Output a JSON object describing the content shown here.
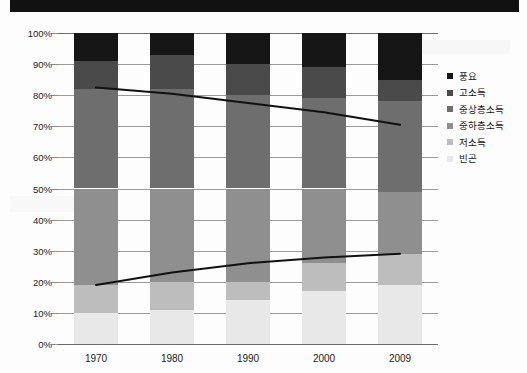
{
  "banner": {
    "color": "#111111",
    "text": ""
  },
  "legend": {
    "position": "right",
    "items": [
      {
        "label": "풍요",
        "color": "#161616"
      },
      {
        "label": "고소득",
        "color": "#4a4a4a"
      },
      {
        "label": "중상층소득",
        "color": "#6e6e6e"
      },
      {
        "label": "중하층소득",
        "color": "#8f8f8f"
      },
      {
        "label": "저소득",
        "color": "#bdbdbd"
      },
      {
        "label": "빈곤",
        "color": "#e8e8e8"
      }
    ]
  },
  "axes": {
    "y_ticks": [
      "0%",
      "10%",
      "20%",
      "30%",
      "40%",
      "50%",
      "60%",
      "70%",
      "80%",
      "90%",
      "100%"
    ],
    "x_ticks": [
      "1970",
      "1980",
      "1990",
      "2000",
      "2009"
    ]
  },
  "chart_data": {
    "type": "bar",
    "title": "",
    "subtitle": "",
    "xlabel": "",
    "ylabel": "",
    "ylim": [
      0,
      100
    ],
    "grid": true,
    "stacked": true,
    "stack_total": 100,
    "legend_position": "right",
    "categories": [
      "1970",
      "1980",
      "1990",
      "2000",
      "2009"
    ],
    "series": [
      {
        "name": "빈곤",
        "color": "#e8e8e8",
        "values": [
          10,
          11,
          14,
          17,
          19
        ]
      },
      {
        "name": "저소득",
        "color": "#bdbdbd",
        "values": [
          9,
          9,
          6,
          9,
          10
        ]
      },
      {
        "name": "중하층소득",
        "color": "#8f8f8f",
        "values": [
          31,
          30,
          30,
          24,
          20
        ]
      },
      {
        "name": "중상층소득",
        "color": "#6e6e6e",
        "values": [
          32,
          32,
          30,
          29,
          29
        ]
      },
      {
        "name": "고소득",
        "color": "#4a4a4a",
        "values": [
          9,
          11,
          10,
          10,
          7
        ]
      },
      {
        "name": "풍요",
        "color": "#161616",
        "values": [
          9,
          7,
          10,
          11,
          15
        ]
      }
    ],
    "overlay_lines": [
      {
        "name": "upper-trend-line",
        "color": "#111111",
        "x": [
          "1970",
          "1980",
          "1990",
          "2000",
          "2009"
        ],
        "values": [
          82.5,
          80.5,
          77.5,
          74.5,
          70.5
        ]
      },
      {
        "name": "lower-trend-line",
        "color": "#111111",
        "x": [
          "1970",
          "1980",
          "1990",
          "2000",
          "2009"
        ],
        "values": [
          19.0,
          23.0,
          26.0,
          27.8,
          29.0
        ]
      }
    ]
  }
}
